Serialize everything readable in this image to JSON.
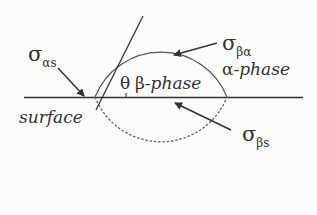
{
  "diagram": {
    "title": "",
    "labels": {
      "sigma_alpha_s": {
        "symbol": "σ",
        "subscript": "αs"
      },
      "sigma_beta_alpha": {
        "symbol": "σ",
        "subscript": "βα"
      },
      "sigma_beta_s": {
        "symbol": "σ",
        "subscript": "βs"
      },
      "theta": "θ",
      "beta_prefix": "β-",
      "beta_phase": "phase",
      "alpha_prefix": "α-",
      "alpha_phase": "phase",
      "surface": "surface"
    },
    "colors": {
      "line": "#333333",
      "arc": "#555555",
      "dashed": "#666666",
      "background": "#fbfbfa"
    }
  }
}
